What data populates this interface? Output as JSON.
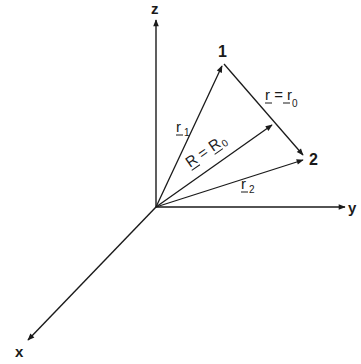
{
  "diagram": {
    "type": "3d-coordinate-vectors",
    "axes": {
      "z": {
        "label": "z"
      },
      "y": {
        "label": "y"
      },
      "x": {
        "label": "x"
      }
    },
    "points": [
      {
        "id": "1",
        "label": "1"
      },
      {
        "id": "2",
        "label": "2"
      }
    ],
    "vectors": [
      {
        "id": "r1",
        "label": "r",
        "subscript": "1",
        "from": "origin",
        "to": "1"
      },
      {
        "id": "r2",
        "label": "r",
        "subscript": "2",
        "from": "origin",
        "to": "2"
      },
      {
        "id": "R",
        "label": "R = R",
        "subscript": "0",
        "from": "origin",
        "to": "midpoint-of-1-2"
      },
      {
        "id": "r",
        "label": "r = r",
        "subscript": "0",
        "from": "1",
        "to": "2"
      }
    ],
    "colors": {
      "line": "#1a1a1a",
      "background": "#ffffff"
    }
  }
}
